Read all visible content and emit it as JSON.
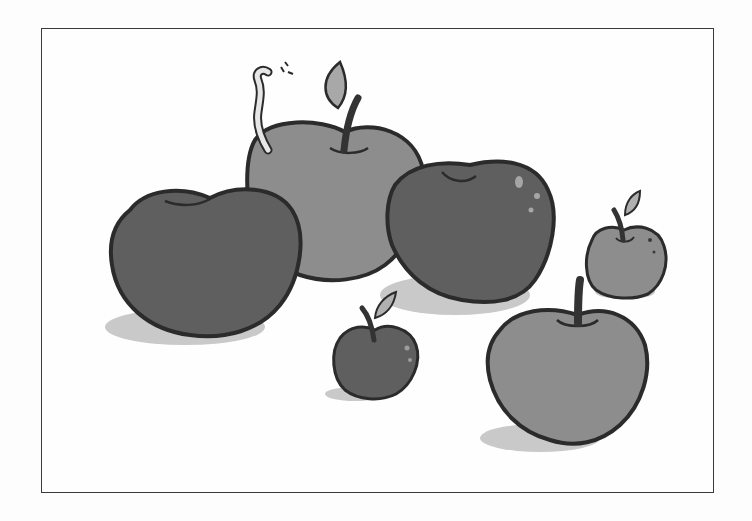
{
  "illustration": {
    "subject": "Apples illustration",
    "apple_count": 6,
    "has_worm": true,
    "colors": {
      "outline": "#2b2b2b",
      "apple_dark": "#5e5e5e",
      "apple_mid": "#8a8a8a",
      "apple_light": "#9a9a9a",
      "shadow": "#c8c8c8",
      "leaf": "#a9a9a9",
      "stem": "#3a3a3a",
      "worm": "#e4e4e4",
      "frame_border": "#3a3a3a",
      "background": "#fefefe"
    }
  }
}
